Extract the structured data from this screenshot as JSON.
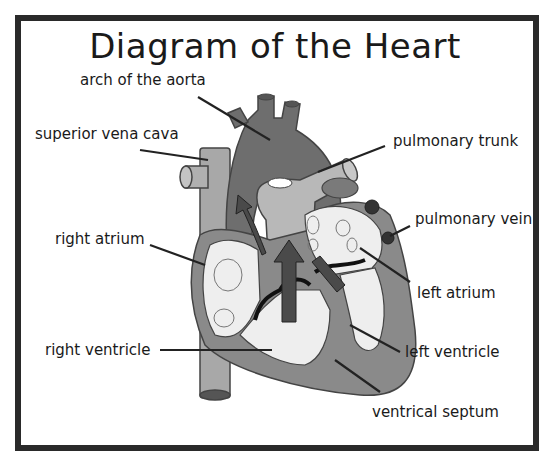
{
  "title": "Diagram of the Heart",
  "labels": {
    "arch_of_aorta": "arch of the aorta",
    "superior_vena_cava": "superior vena cava",
    "right_atrium": "right atrium",
    "right_ventricle": "right ventricle",
    "pulmonary_trunk": "pulmonary trunk",
    "pulmonary_vein": "pulmonary vein",
    "left_atrium": "left atrium",
    "left_ventricle": "left ventricle",
    "ventrical_septum": "ventrical septum"
  },
  "colors": {
    "border": "#2a2a2a",
    "dark_tissue": "#6e6e6e",
    "mid_tissue": "#9a9a9a",
    "light_vessel": "#b8b8b8",
    "chamber": "#eeeeee",
    "arrow": "#4a4a4a",
    "vein_dark": "#333333"
  }
}
